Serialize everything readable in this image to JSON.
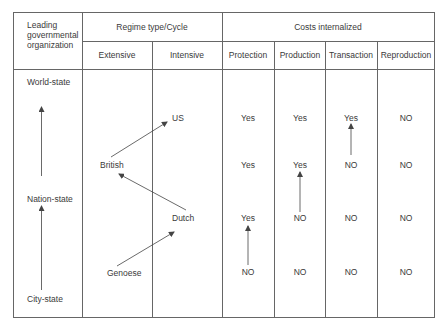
{
  "header": {
    "leading_org": [
      "Leading",
      "governmental",
      "organization"
    ],
    "regime_group": "Regime type/Cycle",
    "costs_group": "Costs internalized",
    "columns": [
      "Extensive",
      "Intensive",
      "Protection",
      "Production",
      "Transaction",
      "Reproduction"
    ]
  },
  "levels": {
    "world_state": "World-state",
    "nation_state": "Nation-state",
    "city_state": "City-state"
  },
  "regimes": {
    "us": "US",
    "british": "British",
    "dutch": "Dutch",
    "genoese": "Genoese"
  },
  "rows": [
    {
      "regime": "US",
      "protection": "Yes",
      "production": "Yes",
      "transaction": "Yes",
      "reproduction": "NO"
    },
    {
      "regime": "British",
      "protection": "Yes",
      "production": "Yes",
      "transaction": "NO",
      "reproduction": "NO"
    },
    {
      "regime": "Dutch",
      "protection": "Yes",
      "production": "NO",
      "transaction": "NO",
      "reproduction": "NO"
    },
    {
      "regime": "Genoese",
      "protection": "NO",
      "production": "NO",
      "transaction": "NO",
      "reproduction": "NO"
    }
  ],
  "colors": {
    "line": "#555555",
    "text": "#3a3a3a"
  }
}
